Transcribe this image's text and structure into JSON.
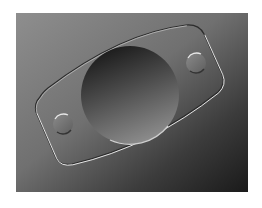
{
  "image": {
    "subject": "embossed plate with central circular recess and two small round bosses",
    "colors": {
      "page_background": "#ffffff",
      "bg_top_left": "#8e8e8e",
      "bg_mid": "#6a6a6a",
      "bg_bottom_right": "#1e1e1e",
      "recess_dark": "#1c1c1c",
      "recess_light": "#8a8a8a",
      "highlight": "#e6e6e6",
      "shadow": "#2a2a2a"
    },
    "frame": {
      "x": 16,
      "y": 13,
      "width": 232,
      "height": 179
    },
    "recess": {
      "cx": 130,
      "cy": 95,
      "r": 49
    },
    "bosses": [
      {
        "cx": 63,
        "cy": 124,
        "r": 10
      },
      {
        "cx": 196,
        "cy": 63,
        "r": 10
      }
    ]
  }
}
